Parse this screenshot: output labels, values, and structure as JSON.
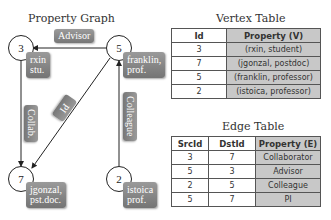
{
  "graph": {
    "title": "Property Graph",
    "nodes": [
      {
        "id": "3",
        "label_line1": "rxin",
        "label_line2": "stu."
      },
      {
        "id": "5",
        "label_line1": "franklin,",
        "label_line2": "prof."
      },
      {
        "id": "7",
        "label_line1": "jgonzal,",
        "label_line2": "pst.doc."
      },
      {
        "id": "2",
        "label_line1": "istoica",
        "label_line2": "prof."
      }
    ],
    "edges": [
      {
        "src": "5",
        "dst": "3",
        "label": "Advisor"
      },
      {
        "src": "3",
        "dst": "7",
        "label": "Collab."
      },
      {
        "src": "5",
        "dst": "7",
        "label": "PI"
      },
      {
        "src": "2",
        "dst": "5",
        "label": "Colleague"
      }
    ]
  },
  "vertex_table": {
    "title": "Vertex Table",
    "headers": [
      "Id",
      "Property (V)"
    ],
    "rows": [
      [
        "3",
        "(rxin, student)"
      ],
      [
        "7",
        "(jgonzal, postdoc)"
      ],
      [
        "5",
        "(franklin, professor)"
      ],
      [
        "2",
        "(istoica, professor)"
      ]
    ]
  },
  "edge_table": {
    "title": "Edge Table",
    "headers": [
      "SrcId",
      "DstId",
      "Property (E)"
    ],
    "rows": [
      [
        "3",
        "7",
        "Collaborator"
      ],
      [
        "5",
        "3",
        "Advisor"
      ],
      [
        "2",
        "5",
        "Colleague"
      ],
      [
        "5",
        "7",
        "PI"
      ]
    ]
  },
  "colors": {
    "property_column_bg": "#c8c8c8",
    "label_box_bg": "#888888"
  }
}
